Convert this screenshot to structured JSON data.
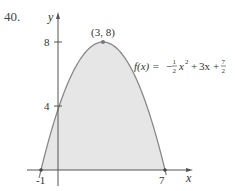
{
  "problem_number": "40.",
  "chart_data": {
    "type": "area",
    "title": "",
    "function_label": "f(x) = -1/2 x^2 + 3x + 7/2",
    "function": {
      "a": -0.5,
      "b": 3,
      "c": 3.5
    },
    "xlabel": "x",
    "ylabel": "y",
    "x_ticks": [
      {
        "value": -1,
        "label": "-1"
      },
      {
        "value": 7,
        "label": "7"
      }
    ],
    "y_ticks": [
      {
        "value": 4,
        "label": "4"
      },
      {
        "value": 8,
        "label": "8"
      }
    ],
    "annotations": [
      {
        "x": 3,
        "y": 8,
        "label": "(3, 8)"
      }
    ],
    "points": [
      {
        "x": -1,
        "y": 0
      },
      {
        "x": 0,
        "y": 3.5
      },
      {
        "x": 1,
        "y": 6
      },
      {
        "x": 2,
        "y": 7.5
      },
      {
        "x": 3,
        "y": 8
      },
      {
        "x": 4,
        "y": 7.5
      },
      {
        "x": 5,
        "y": 6
      },
      {
        "x": 6,
        "y": 3.5
      },
      {
        "x": 7,
        "y": 0
      }
    ],
    "shaded_region": {
      "from_x": -1,
      "to_x": 7,
      "between": "curve and x-axis"
    },
    "xlim": [
      -2,
      8.5
    ],
    "ylim": [
      -1,
      9.5
    ],
    "grid": false,
    "colors": {
      "fill": "#e6e6e6",
      "curve": "#888888",
      "axes": "#555555",
      "text": "#333333"
    }
  },
  "labels": {
    "y_axis": "y",
    "x_axis": "x",
    "tick_8": "8",
    "tick_4": "4",
    "tick_neg1": "-1",
    "tick_7": "7",
    "vertex": "(3, 8)",
    "fx": "f(x) = ",
    "minus": "−",
    "plus": "+",
    "one": "1",
    "two": "2",
    "seven": "7",
    "x_sq_x": "x",
    "sq": "2",
    "three_x": "3x"
  }
}
